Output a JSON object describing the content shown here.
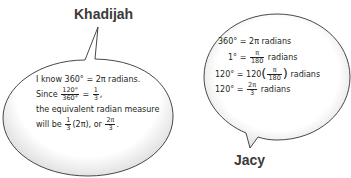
{
  "khadijah": {
    "name": "Khadijah",
    "line1": "I know 360° = 2π radians.",
    "line2_prefix": "Since",
    "line2_frac_num": "120°",
    "line2_frac_den": "360°",
    "line2_eq": "=",
    "line2_rhs_num": "1",
    "line2_rhs_den": "3",
    "line2_suffix": ",",
    "line3": "the equivalent radian measure",
    "line4_prefix": "will be",
    "line4_frac_num": "1",
    "line4_frac_den": "3",
    "line4_mid": "(2π), or",
    "line4_frac2_num": "2π",
    "line4_frac2_den": "3",
    "line4_suffix": "."
  },
  "jacy": {
    "name": "Jacy",
    "line1": "360° = 2π radians",
    "line2_lhs": "1° =",
    "line2_num": "π",
    "line2_den": "180",
    "line2_suffix": "radians",
    "line3_lhs": "120° = 120",
    "line3_num": "π",
    "line3_den": "180",
    "line3_suffix": "radians",
    "line4_lhs": "120° =",
    "line4_num": "2π",
    "line4_den": "3",
    "line4_suffix": "radians"
  },
  "paren_open": "(",
  "paren_close": ")"
}
